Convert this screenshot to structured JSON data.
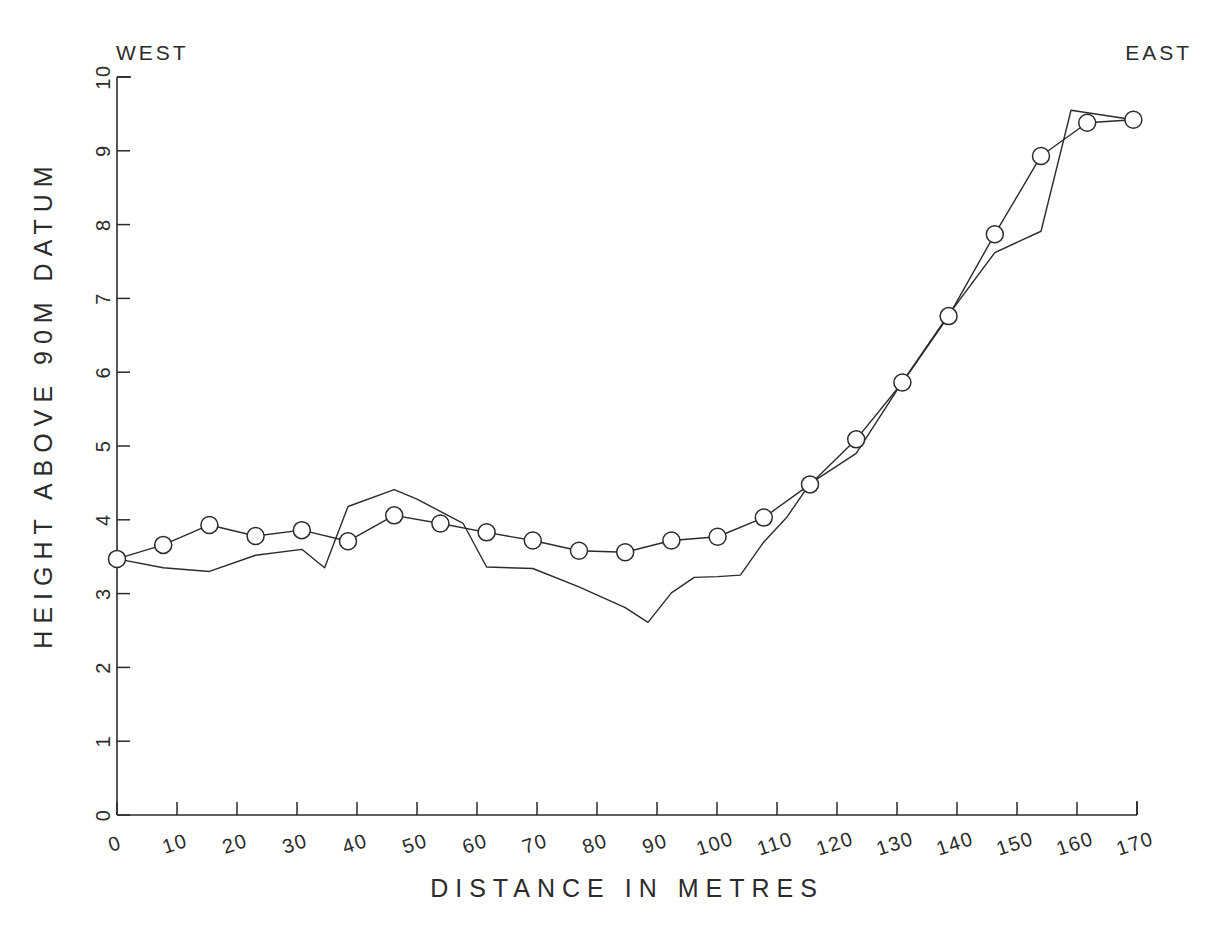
{
  "chart_data": {
    "type": "line",
    "title": "",
    "xlabel": "DISTANCE IN METRES",
    "ylabel": "HEIGHT ABOVE 90M DATUM",
    "xlim": [
      0,
      170
    ],
    "ylim": [
      0,
      10
    ],
    "xticks": [
      0,
      10,
      20,
      30,
      40,
      50,
      60,
      70,
      80,
      90,
      100,
      110,
      120,
      130,
      140,
      150,
      160,
      170
    ],
    "yticks": [
      0,
      1,
      2,
      3,
      4,
      5,
      6,
      7,
      8,
      9,
      10
    ],
    "grid": false,
    "legend": null,
    "annotations": [
      {
        "text": "WEST",
        "position": "top-left"
      },
      {
        "text": "EAST",
        "position": "top-right"
      }
    ],
    "series": [
      {
        "name": "surveyed-profile-with-markers",
        "marker": "circle",
        "x": [
          0.0,
          7.7,
          15.4,
          23.1,
          30.8,
          38.5,
          46.2,
          53.9,
          61.6,
          69.3,
          77.0,
          84.7,
          92.4,
          100.1,
          107.8,
          115.5,
          123.2,
          130.9,
          138.6,
          146.3,
          154.0,
          161.7,
          169.4
        ],
        "y": [
          3.47,
          3.66,
          3.93,
          3.78,
          3.86,
          3.71,
          4.06,
          3.95,
          3.83,
          3.72,
          3.58,
          3.56,
          3.72,
          3.77,
          4.03,
          4.48,
          5.09,
          5.86,
          6.76,
          7.87,
          8.93,
          9.38,
          9.42
        ]
      },
      {
        "name": "ground-surface-profile",
        "marker": "none",
        "x": [
          0.0,
          7.7,
          15.4,
          23.1,
          30.8,
          34.6,
          38.5,
          46.2,
          50.0,
          57.7,
          61.6,
          69.3,
          77.0,
          84.7,
          88.5,
          92.4,
          96.2,
          100.1,
          103.9,
          107.8,
          111.6,
          115.5,
          123.2,
          130.9,
          138.6,
          146.3,
          154.0,
          159.0,
          169.4
        ],
        "y": [
          3.47,
          3.35,
          3.3,
          3.52,
          3.6,
          3.35,
          4.18,
          4.41,
          4.28,
          3.95,
          3.36,
          3.34,
          3.09,
          2.81,
          2.61,
          3.01,
          3.22,
          3.23,
          3.25,
          3.7,
          4.03,
          4.49,
          4.9,
          5.87,
          6.78,
          7.62,
          7.91,
          9.55,
          9.42
        ]
      }
    ]
  },
  "axes": {
    "x_title": "DISTANCE IN METRES",
    "y_title": "HEIGHT ABOVE 90M DATUM",
    "x_tick_labels": [
      "0",
      "10",
      "20",
      "30",
      "40",
      "50",
      "60",
      "70",
      "80",
      "90",
      "100",
      "110",
      "120",
      "130",
      "140",
      "150",
      "160",
      "170"
    ],
    "y_tick_labels": [
      "0",
      "1",
      "2",
      "3",
      "4",
      "5",
      "6",
      "7",
      "8",
      "9",
      "10"
    ]
  },
  "labels": {
    "west": "WEST",
    "east": "EAST"
  },
  "colors": {
    "ink": "#2b2b2b",
    "background": "#ffffff"
  }
}
